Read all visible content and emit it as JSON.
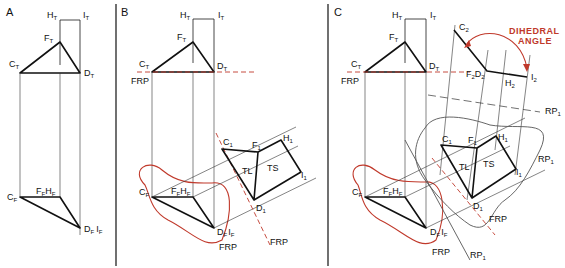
{
  "panels": [
    {
      "id": "A",
      "label": "A"
    },
    {
      "id": "B",
      "label": "B"
    },
    {
      "id": "C",
      "label": "C"
    }
  ],
  "labels": {
    "HT": {
      "main": "H",
      "sub": "T"
    },
    "IT": {
      "main": "I",
      "sub": "T"
    },
    "FT": {
      "main": "F",
      "sub": "T"
    },
    "CT": {
      "main": "C",
      "sub": "T"
    },
    "DT": {
      "main": "D",
      "sub": "T"
    },
    "CF": {
      "main": "C",
      "sub": "F"
    },
    "FFHF": {
      "main1": "F",
      "sub1": "F",
      "main2": "H",
      "sub2": "F"
    },
    "DFIF": {
      "main1": "D",
      "sub1": "F",
      "main2": "I",
      "sub2": "F"
    },
    "C1": {
      "main": "C",
      "sub": "1"
    },
    "F1": {
      "main": "F",
      "sub": "1"
    },
    "H1": {
      "main": "H",
      "sub": "1"
    },
    "I1": {
      "main": "I",
      "sub": "1"
    },
    "D1": {
      "main": "D",
      "sub": "1"
    },
    "C2": {
      "main": "C",
      "sub": "2"
    },
    "F2D2": {
      "main1": "F",
      "sub1": "2",
      "main2": "D",
      "sub2": "2"
    },
    "H2": {
      "main": "H",
      "sub": "2"
    },
    "I2": {
      "main": "I",
      "sub": "2"
    },
    "RP1": {
      "main": "RP",
      "sub": "1"
    },
    "FRP": "FRP",
    "TL": "TL",
    "TS": "TS"
  },
  "annotation": {
    "line1": "DIHEDRAL",
    "line2": "ANGLE",
    "color": "#c0392b"
  }
}
